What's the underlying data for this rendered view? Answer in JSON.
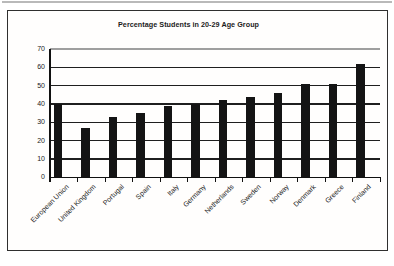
{
  "title": "Percentage Students in 20-29 Age Group",
  "frame": {
    "border_color": "#2f2f2f",
    "background": "#ffffff"
  },
  "chart_data": {
    "type": "bar",
    "title": "Percentage Students in 20-29 Age Group",
    "categories": [
      "European Union",
      "United Kingdom",
      "Portugal",
      "Spain",
      "Italy",
      "Germany",
      "Netherlands",
      "Sweden",
      "Norway",
      "Denmark",
      "Greece",
      "Finland"
    ],
    "values": [
      40,
      27,
      33,
      35,
      39,
      40,
      42,
      44,
      46,
      51,
      51,
      62
    ],
    "xlabel": "",
    "ylabel": "",
    "ylim": [
      0,
      70
    ],
    "yticks": [
      0,
      10,
      20,
      30,
      40,
      50,
      60,
      70
    ],
    "grid": true,
    "legend": "none",
    "bar_color": "#141414",
    "gridline_color": "#1f1f1f",
    "top_gridline_color": "#9f9f9f",
    "axis_color": "#111111",
    "label_color": "#1a1a1a"
  }
}
